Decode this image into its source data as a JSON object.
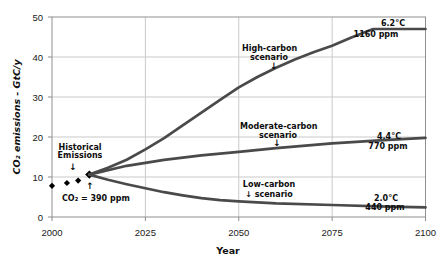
{
  "chart_data": {
    "type": "line",
    "title": "",
    "xlabel": "Year",
    "ylabel": "CO₂ emissions - GtC/y",
    "xlim": [
      2000,
      2100
    ],
    "ylim": [
      0,
      50
    ],
    "x_ticks": [
      2000,
      2025,
      2050,
      2075,
      2100
    ],
    "y_ticks": [
      0,
      10,
      20,
      30,
      40,
      50
    ],
    "grid": true,
    "legend": "none (inline annotations)",
    "colors": {
      "series_line": "#4a4a4a",
      "marker": "#000000",
      "grid": "#c9c9c9",
      "frame": "#8f8f8f",
      "text": "#0d0d0d"
    },
    "series": [
      {
        "name": "Historical Emissions",
        "type": "scatter",
        "marker": "diamond",
        "points": [
          [
            2000,
            7.8
          ],
          [
            2004,
            8.5
          ],
          [
            2007,
            9.1
          ],
          [
            2010,
            10.6
          ]
        ]
      },
      {
        "name": "High-carbon scenario",
        "type": "line",
        "points": [
          [
            2010,
            10.6
          ],
          [
            2015,
            12.3
          ],
          [
            2020,
            14.3
          ],
          [
            2025,
            16.9
          ],
          [
            2030,
            19.7
          ],
          [
            2035,
            22.9
          ],
          [
            2040,
            26.1
          ],
          [
            2045,
            29.3
          ],
          [
            2050,
            32.4
          ],
          [
            2055,
            35.0
          ],
          [
            2060,
            37.3
          ],
          [
            2065,
            39.4
          ],
          [
            2070,
            41.2
          ],
          [
            2075,
            42.8
          ],
          [
            2080,
            44.8
          ],
          [
            2086,
            47.0
          ],
          [
            2100,
            47.0
          ]
        ]
      },
      {
        "name": "Moderate-carbon scenario",
        "type": "line",
        "points": [
          [
            2010,
            10.6
          ],
          [
            2020,
            12.8
          ],
          [
            2030,
            14.3
          ],
          [
            2040,
            15.4
          ],
          [
            2050,
            16.3
          ],
          [
            2060,
            17.2
          ],
          [
            2075,
            18.4
          ],
          [
            2090,
            19.3
          ],
          [
            2100,
            19.8
          ]
        ]
      },
      {
        "name": "Low-carbon scenario",
        "type": "line",
        "points": [
          [
            2010,
            10.6
          ],
          [
            2015,
            9.3
          ],
          [
            2020,
            8.2
          ],
          [
            2025,
            7.2
          ],
          [
            2030,
            6.2
          ],
          [
            2035,
            5.4
          ],
          [
            2040,
            4.7
          ],
          [
            2045,
            4.2
          ],
          [
            2050,
            3.9
          ],
          [
            2060,
            3.4
          ],
          [
            2075,
            3.0
          ],
          [
            2090,
            2.6
          ],
          [
            2100,
            2.4
          ]
        ]
      }
    ],
    "annotations": {
      "historical": {
        "line1": "Historical",
        "line2": "Emissions",
        "down_arrow": "↓",
        "up_arrow": "↑",
        "co2_note": "CO₂ = 390 ppm"
      },
      "high": {
        "line1": "High-carbon",
        "line2": "scenario",
        "arrow": "↓",
        "temp": "6.2°C",
        "ppm": "1160 ppm"
      },
      "moderate": {
        "line1": "Moderate-carbon",
        "line2": "scenario",
        "arrow": "↓",
        "temp": "4.4°C",
        "ppm": "770 ppm"
      },
      "low": {
        "line1": "Low-carbon",
        "line2": "↓ scenario",
        "temp": "2.0°C",
        "ppm": "440 ppm"
      }
    }
  }
}
